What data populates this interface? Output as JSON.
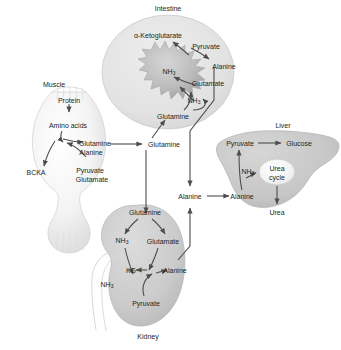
{
  "figure": {
    "type": "interorgan-metabolism-diagram",
    "title_visible": false,
    "background_color": "#ffffff",
    "text_color": "#231f20",
    "arrow_color": "#4d4d4d"
  },
  "organs": [
    {
      "id": "muscle",
      "name": "Muscle",
      "title_label": "Muscle",
      "fill": "#efefef",
      "labels": [
        {
          "key": "protein",
          "text": "Protein"
        },
        {
          "key": "amino_acids",
          "text": "Amino acids"
        },
        {
          "key": "glutamine",
          "text": "Glutamine"
        },
        {
          "key": "alanine",
          "text": "Alanine"
        },
        {
          "key": "bcka",
          "text": "BCKA"
        },
        {
          "key": "pyruvate",
          "text": "Pyruvate"
        },
        {
          "key": "glutamate",
          "text": "Glutamate"
        }
      ]
    },
    {
      "id": "intestine",
      "name": "Intestine",
      "title_label": "Intestine",
      "fill": "#e3e3e3",
      "labels": [
        {
          "key": "ketoglutarate",
          "text": "α-Ketoglutarate"
        },
        {
          "key": "pyruvate",
          "text": "Pyruvate"
        },
        {
          "key": "alanine",
          "text": "Alanine"
        },
        {
          "key": "glutamate",
          "text": "Glutamate"
        },
        {
          "key": "nh3_core",
          "text": "NH3"
        },
        {
          "key": "nh3_lower",
          "text": "NH3"
        },
        {
          "key": "glutamine",
          "text": "Glutamine"
        }
      ]
    },
    {
      "id": "liver",
      "name": "Liver",
      "title_label": "Liver",
      "fill": "#c9c9c9",
      "labels": [
        {
          "key": "pyruvate",
          "text": "Pyruvate"
        },
        {
          "key": "glucose",
          "text": "Glucose"
        },
        {
          "key": "nh3",
          "text": "NH3"
        },
        {
          "key": "urea_cycle",
          "text": "Urea\ncycle"
        },
        {
          "key": "urea_cycle_line1",
          "text": "Urea"
        },
        {
          "key": "urea_cycle_line2",
          "text": "cycle"
        },
        {
          "key": "alanine",
          "text": "Alanine"
        },
        {
          "key": "urea",
          "text": "Urea"
        }
      ]
    },
    {
      "id": "kidney",
      "name": "Kidney",
      "title_label": "Kidney",
      "fill": "#cfcfcf",
      "labels": [
        {
          "key": "glutamine",
          "text": "Glutamine"
        },
        {
          "key": "nh3_in",
          "text": "NH3"
        },
        {
          "key": "glutamate",
          "text": "Glutamate"
        },
        {
          "key": "kg",
          "text": "KG"
        },
        {
          "key": "alanine",
          "text": "Alanine"
        },
        {
          "key": "nh3_out",
          "text": "NH3"
        },
        {
          "key": "pyruvate",
          "text": "Pyruvate"
        }
      ]
    }
  ],
  "bloodstream": {
    "name": "circulating-metabolites",
    "labels": [
      {
        "key": "glutamine",
        "text": "Glutamine"
      },
      {
        "key": "alanine",
        "text": "Alanine"
      }
    ]
  }
}
